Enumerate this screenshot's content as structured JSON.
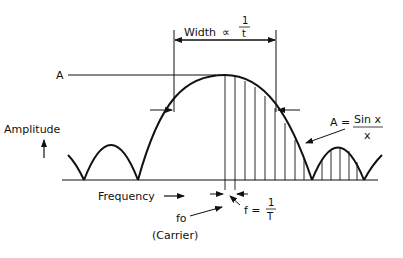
{
  "diagram": {
    "labels": {
      "width": "Width",
      "proportional": "∝",
      "width_frac_num": "1",
      "width_frac_den": "t",
      "peak": "A",
      "amplitude": "Amplitude",
      "formula_lhs": "A =",
      "formula_num": "Sin x",
      "formula_den": "x",
      "frequency": "Frequency",
      "carrier_symbol": "fo",
      "carrier_label": "(Carrier)",
      "spacing_lhs": "f =",
      "spacing_num": "1",
      "spacing_den": "T"
    },
    "colors": {
      "ink": "#111111",
      "background": "#ffffff"
    }
  }
}
